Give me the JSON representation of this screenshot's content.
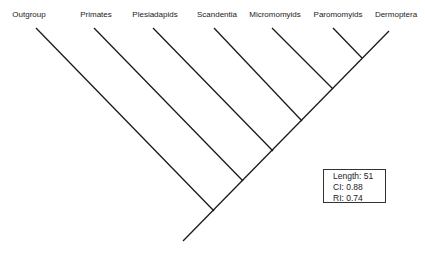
{
  "taxa": [
    {
      "label": "Outgroup",
      "x": 29
    },
    {
      "label": "Primates",
      "x": 96
    },
    {
      "label": "Plesiadapids",
      "x": 155
    },
    {
      "label": "Scandentia",
      "x": 217
    },
    {
      "label": "Micromomyids",
      "x": 275
    },
    {
      "label": "Paromomyids",
      "x": 338
    },
    {
      "label": "Dermoptera",
      "x": 396
    }
  ],
  "stats": {
    "length": "Length: 51",
    "ci": "CI: 0.88",
    "ri": "RI: 0.74"
  },
  "colors": {
    "line": "#1a1a1a",
    "text": "#222222"
  }
}
